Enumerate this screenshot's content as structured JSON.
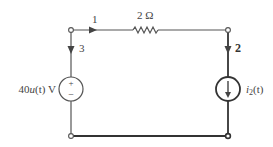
{
  "diagram": {
    "type": "circuit",
    "branches": [
      {
        "id": "1",
        "label": "1",
        "element": "resistor",
        "value_label": "2 Ω"
      },
      {
        "id": "2",
        "label": "2",
        "element": "current_source",
        "value_label": "i2(t)"
      },
      {
        "id": "3",
        "label": "3",
        "element": "voltage_source",
        "value_label": "40u(t) V"
      }
    ],
    "resistor": {
      "label": "2 Ω"
    },
    "voltage_source": {
      "label_prefix": "40",
      "label_func": "u",
      "label_arg": "(t)",
      "label_unit": " V",
      "plus": "+",
      "minus": "−"
    },
    "current_source": {
      "label_var": "i",
      "label_sub": "2",
      "label_arg": "(t)"
    },
    "branch_labels": {
      "b1": "1",
      "b2": "2",
      "b3": "3"
    },
    "colors": {
      "wire": "#555555",
      "thick_wire": "#333333",
      "background": "#ffffff"
    }
  }
}
